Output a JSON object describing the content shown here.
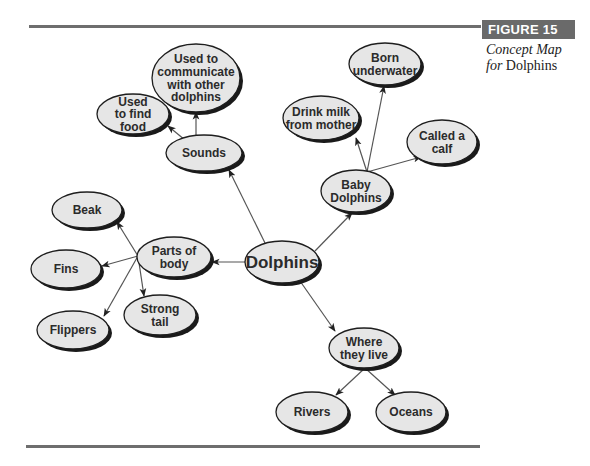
{
  "figure": {
    "label": "FIGURE 15",
    "caption_line1": "Concept Map",
    "caption_line2_italic": "for",
    "caption_line2_rest": " Dolphins"
  },
  "colors": {
    "node_fill": "#e6e6e6",
    "node_stroke": "#1e1e1e",
    "node_shadow": "#1a1a1a",
    "edge": "#555555",
    "rule": "#6e6e6e",
    "label_bg": "#6a6a6a"
  },
  "nodes": [
    {
      "id": "dolphins",
      "lines": [
        "Dolphins"
      ],
      "cx": 282,
      "cy": 262,
      "rx": 37,
      "ry": 21,
      "font": 17
    },
    {
      "id": "sounds",
      "lines": [
        "Sounds"
      ],
      "cx": 204,
      "cy": 153,
      "rx": 38,
      "ry": 18,
      "font": 12
    },
    {
      "id": "communicate",
      "lines": [
        "Used to",
        "communicate",
        "with other",
        "dolphins"
      ],
      "cx": 196,
      "cy": 78,
      "rx": 44,
      "ry": 34,
      "font": 12
    },
    {
      "id": "find-food",
      "lines": [
        "Used",
        "to find",
        "food"
      ],
      "cx": 133,
      "cy": 114,
      "rx": 36,
      "ry": 20,
      "font": 12
    },
    {
      "id": "baby-dolphins",
      "lines": [
        "Baby",
        "Dolphins"
      ],
      "cx": 356,
      "cy": 191,
      "rx": 35,
      "ry": 21,
      "font": 12
    },
    {
      "id": "born-underwater",
      "lines": [
        "Born",
        "underwater"
      ],
      "cx": 385,
      "cy": 64,
      "rx": 36,
      "ry": 21,
      "font": 12
    },
    {
      "id": "drink-milk",
      "lines": [
        "Drink milk",
        "from mother"
      ],
      "cx": 321,
      "cy": 118,
      "rx": 38,
      "ry": 22,
      "font": 12
    },
    {
      "id": "called-calf",
      "lines": [
        "Called a",
        "calf"
      ],
      "cx": 442,
      "cy": 142,
      "rx": 35,
      "ry": 22,
      "font": 12
    },
    {
      "id": "parts-of-body",
      "lines": [
        "Parts of",
        "body"
      ],
      "cx": 174,
      "cy": 257,
      "rx": 37,
      "ry": 20,
      "font": 12
    },
    {
      "id": "beak",
      "lines": [
        "Beak"
      ],
      "cx": 87,
      "cy": 210,
      "rx": 35,
      "ry": 18,
      "font": 12
    },
    {
      "id": "fins",
      "lines": [
        "Fins"
      ],
      "cx": 66,
      "cy": 269,
      "rx": 35,
      "ry": 19,
      "font": 12
    },
    {
      "id": "strong-tail",
      "lines": [
        "Strong",
        "tail"
      ],
      "cx": 160,
      "cy": 315,
      "rx": 36,
      "ry": 20,
      "font": 12
    },
    {
      "id": "flippers",
      "lines": [
        "Flippers"
      ],
      "cx": 73,
      "cy": 330,
      "rx": 36,
      "ry": 19,
      "font": 12
    },
    {
      "id": "where-they-live",
      "lines": [
        "Where",
        "they live"
      ],
      "cx": 364,
      "cy": 348,
      "rx": 35,
      "ry": 20,
      "font": 12
    },
    {
      "id": "rivers",
      "lines": [
        "Rivers"
      ],
      "cx": 312,
      "cy": 412,
      "rx": 36,
      "ry": 20,
      "font": 12
    },
    {
      "id": "oceans",
      "lines": [
        "Oceans"
      ],
      "cx": 411,
      "cy": 412,
      "rx": 35,
      "ry": 20,
      "font": 12
    }
  ],
  "edges": [
    {
      "from": "dolphins",
      "to": "sounds",
      "x1": 265,
      "y1": 243,
      "x2": 229,
      "y2": 170
    },
    {
      "from": "sounds",
      "to": "communicate",
      "x1": 196,
      "y1": 136,
      "x2": 196,
      "y2": 112
    },
    {
      "from": "sounds",
      "to": "find-food",
      "x1": 185,
      "y1": 140,
      "x2": 168,
      "y2": 126
    },
    {
      "from": "dolphins",
      "to": "baby-dolphins",
      "x1": 315,
      "y1": 251,
      "x2": 352,
      "y2": 213
    },
    {
      "from": "baby-dolphins",
      "to": "born-underwater",
      "x1": 367,
      "y1": 172,
      "x2": 384,
      "y2": 86
    },
    {
      "from": "baby-dolphins",
      "to": "drink-milk",
      "x1": 367,
      "y1": 172,
      "x2": 356,
      "y2": 138
    },
    {
      "from": "baby-dolphins",
      "to": "called-calf",
      "x1": 367,
      "y1": 172,
      "x2": 421,
      "y2": 157
    },
    {
      "from": "dolphins",
      "to": "parts-of-body",
      "x1": 245,
      "y1": 262,
      "x2": 212,
      "y2": 262
    },
    {
      "from": "parts-of-body",
      "to": "beak",
      "x1": 138,
      "y1": 256,
      "x2": 117,
      "y2": 222
    },
    {
      "from": "parts-of-body",
      "to": "fins",
      "x1": 138,
      "y1": 256,
      "x2": 102,
      "y2": 266
    },
    {
      "from": "parts-of-body",
      "to": "strong-tail",
      "x1": 138,
      "y1": 256,
      "x2": 144,
      "y2": 296
    },
    {
      "from": "parts-of-body",
      "to": "flippers",
      "x1": 138,
      "y1": 256,
      "x2": 104,
      "y2": 316
    },
    {
      "from": "dolphins",
      "to": "where-they-live",
      "x1": 300,
      "y1": 281,
      "x2": 335,
      "y2": 331
    },
    {
      "from": "where-they-live",
      "to": "rivers",
      "x1": 365,
      "y1": 368,
      "x2": 336,
      "y2": 395
    },
    {
      "from": "where-they-live",
      "to": "oceans",
      "x1": 365,
      "y1": 368,
      "x2": 395,
      "y2": 395
    }
  ]
}
